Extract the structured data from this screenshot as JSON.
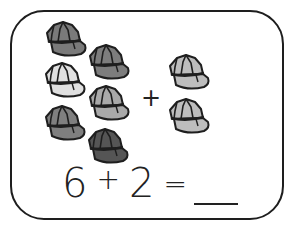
{
  "worksheet": {
    "left_group": {
      "count": 6,
      "items": [
        {
          "icon": "cap-icon",
          "fill": "#7a7a7a",
          "x": 43,
          "y": 20
        },
        {
          "icon": "cap-icon",
          "fill": "#7d7d7d",
          "x": 86,
          "y": 43
        },
        {
          "icon": "cap-icon",
          "fill": "#e0e0e0",
          "x": 42,
          "y": 61
        },
        {
          "icon": "cap-icon",
          "fill": "#a9a9a9",
          "x": 86,
          "y": 84
        },
        {
          "icon": "cap-icon",
          "fill": "#7f7f7f",
          "x": 42,
          "y": 104
        },
        {
          "icon": "cap-icon",
          "fill": "#555555",
          "x": 85,
          "y": 127
        }
      ]
    },
    "operator": "+",
    "right_group": {
      "count": 2,
      "items": [
        {
          "icon": "cap-icon",
          "fill": "#bdbdbd",
          "x": 166,
          "y": 53
        },
        {
          "icon": "cap-icon",
          "fill": "#bdbdbd",
          "x": 166,
          "y": 97
        }
      ]
    },
    "equation": {
      "a": "6",
      "op": "+",
      "b": "2",
      "equals": "=",
      "answer": ""
    }
  }
}
